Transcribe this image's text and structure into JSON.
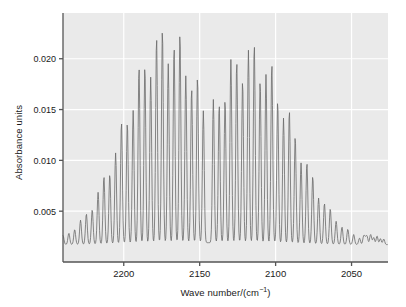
{
  "chart_data": {
    "type": "line",
    "title": "",
    "subtitle": "",
    "xlabel_main": "Wave number/(cm",
    "xlabel_sup": "−1",
    "xlabel_tail": ")",
    "xlabel": "Wave number/(cm−1)",
    "ylabel": "Absorbance units",
    "xlim": [
      2240,
      2026
    ],
    "ylim": [
      0.0,
      0.0245
    ],
    "x_reversed": true,
    "grid": true,
    "grid_color": "#ffffff",
    "plot_background": "#eaeaea",
    "line_color": "#6a6a6a",
    "axis_color": "#555555",
    "legend": null,
    "legend_position": "none",
    "xticks": [
      2200,
      2150,
      2100,
      2050
    ],
    "xticklabels": [
      "2200",
      "2150",
      "2100",
      "2050"
    ],
    "yticks": [
      0.005,
      0.01,
      0.015,
      0.02
    ],
    "yticklabels": [
      "0.005",
      "0.010",
      "0.015",
      "0.020"
    ],
    "baseline": 0.0017,
    "band_center": 2143,
    "branches": [
      {
        "name": "R-branch",
        "peak_wavenumber": 2172,
        "peak_absorbance": 0.0236,
        "line_spacing": 3.85,
        "envelope_width": 38,
        "range": [
          2240,
          2145
        ]
      },
      {
        "name": "P-branch",
        "peak_wavenumber": 2117,
        "peak_absorbance": 0.0219,
        "line_spacing": 3.85,
        "envelope_width": 40,
        "range": [
          2141,
          2026
        ]
      }
    ],
    "series": [
      {
        "name": "IR absorbance spectrum",
        "description": "Rovibrational absorption band with resolved P and R branch rotational lines"
      }
    ]
  },
  "figure": {
    "width": 406,
    "height": 307,
    "plot_left": 63,
    "plot_right": 388,
    "plot_top": 13,
    "plot_bottom": 262
  }
}
